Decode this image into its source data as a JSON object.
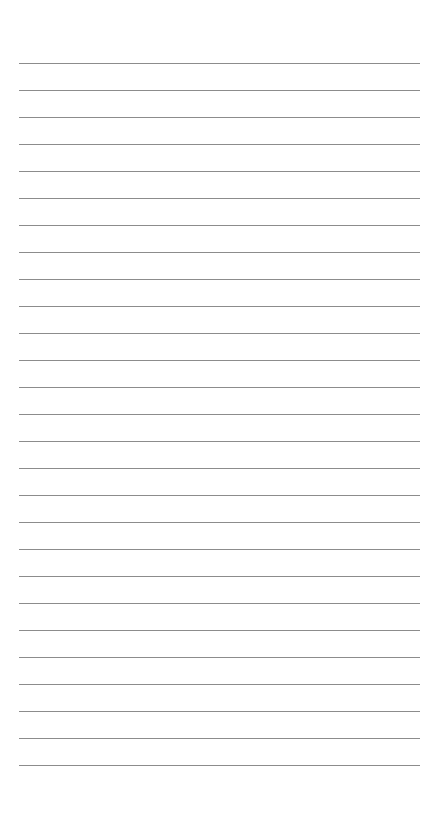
{
  "page": {
    "type": "ruled-paper",
    "background_color": "#ffffff",
    "line_color": "#8c8c8c",
    "line_count": 27,
    "first_line_y": 63,
    "line_spacing": 27,
    "line_left": 19,
    "line_width": 401,
    "text": ""
  }
}
